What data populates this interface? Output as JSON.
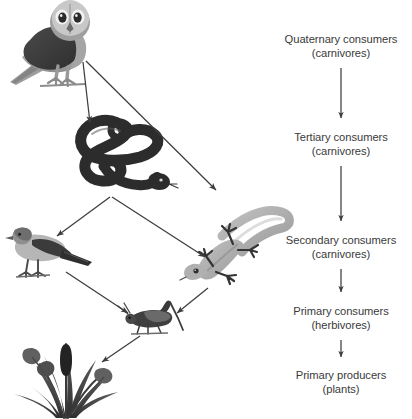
{
  "diagram": {
    "background_color": "#ffffff",
    "text_color": "#3a3a3a",
    "arrow_color": "#3d3d3d"
  },
  "trophic_levels": [
    {
      "id": "quaternary",
      "label": "Quaternary consumers",
      "sublabel": "(carnivores)",
      "x": 341,
      "y": 33,
      "organism": "owl"
    },
    {
      "id": "tertiary",
      "label": "Tertiary consumers",
      "sublabel": "(carnivores)",
      "x": 341,
      "y": 131,
      "organism": "snake"
    },
    {
      "id": "secondary",
      "label": "Secondary consumers",
      "sublabel": "(carnivores)",
      "x": 341,
      "y": 234,
      "organism": "bird-and-lizard"
    },
    {
      "id": "primary-consumers",
      "label": "Primary consumers",
      "sublabel": "(herbivores)",
      "x": 341,
      "y": 305,
      "organism": "grasshopper"
    },
    {
      "id": "primary-producers",
      "label": "Primary producers",
      "sublabel": "(plants)",
      "x": 341,
      "y": 369,
      "organism": "plants"
    }
  ],
  "organisms": [
    {
      "id": "owl",
      "name": "Owl",
      "cx": 50,
      "cy": 45
    },
    {
      "id": "snake",
      "name": "Snake",
      "cx": 118,
      "cy": 152
    },
    {
      "id": "bird",
      "name": "Bird",
      "cx": 42,
      "cy": 243
    },
    {
      "id": "lizard",
      "name": "Lizard",
      "cx": 218,
      "cy": 243
    },
    {
      "id": "grasshopper",
      "name": "Grasshopper",
      "cx": 153,
      "cy": 320
    },
    {
      "id": "plants",
      "name": "Grass",
      "cx": 65,
      "cy": 378
    }
  ],
  "food_chain_arrows": [
    {
      "from": "owl",
      "to": "snake"
    },
    {
      "from": "owl",
      "to": "lizard"
    },
    {
      "from": "snake",
      "to": "bird"
    },
    {
      "from": "snake",
      "to": "lizard"
    },
    {
      "from": "bird",
      "to": "grasshopper"
    },
    {
      "from": "lizard",
      "to": "grasshopper"
    },
    {
      "from": "grasshopper",
      "to": "plants"
    }
  ],
  "tier_arrows": [
    {
      "from": "quaternary",
      "to": "tertiary"
    },
    {
      "from": "tertiary",
      "to": "secondary"
    },
    {
      "from": "secondary",
      "to": "primary-consumers"
    },
    {
      "from": "primary-consumers",
      "to": "primary-producers"
    }
  ]
}
